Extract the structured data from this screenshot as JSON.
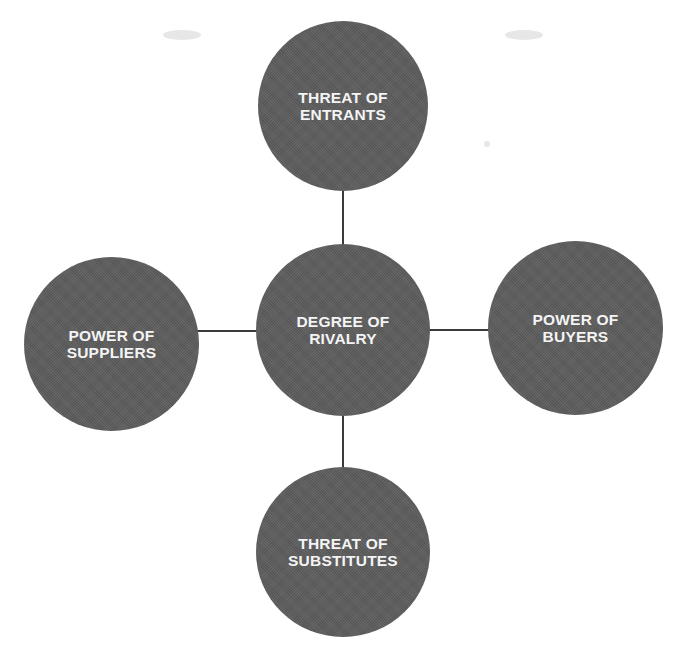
{
  "diagram": {
    "colors": {
      "node_fill": "#5d5d5d",
      "node_text": "#f4f4f4",
      "connector": "#3a3a3a",
      "background": "#ffffff"
    },
    "nodes": {
      "top": {
        "label": "THREAT OF\nENTRANTS"
      },
      "center": {
        "label": "DEGREE OF\nRIVALRY"
      },
      "left": {
        "label": "POWER OF\nSUPPLIERS"
      },
      "right": {
        "label": "POWER OF\nBUYERS"
      },
      "bottom": {
        "label": "THREAT OF\nSUBSTITUTES"
      }
    },
    "edges": [
      {
        "from": "center",
        "to": "top"
      },
      {
        "from": "center",
        "to": "left"
      },
      {
        "from": "center",
        "to": "right"
      },
      {
        "from": "center",
        "to": "bottom"
      }
    ]
  }
}
